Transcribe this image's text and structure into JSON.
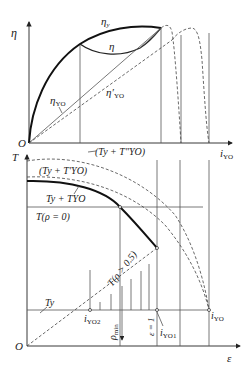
{
  "upper_plot": {
    "y_axis_label": "η",
    "x_axis_label_main": "i",
    "x_axis_label_sub": "YO",
    "origin_label": "O",
    "curves": {
      "eta_y": {
        "main": "η",
        "sub": "y"
      },
      "eta": {
        "main": "η"
      },
      "eta_yo": {
        "main": "η",
        "sub": "YO"
      },
      "eta_yo_prime": {
        "main": "η′",
        "sub": "YO"
      }
    }
  },
  "lower_plot": {
    "y_axis_label": "T",
    "x_axis_label": "ε",
    "origin_label": "O",
    "curves": {
      "ty_tyo_double_prime": "(T",
      "ty_tyo_double_prime_full": "(Ty + T″YO)",
      "ty_tyo_prime_full": "(Ty + T′YO)",
      "ty_tyo_full": "Ty + TYO",
      "t_rho_0": "T(ρ = 0)",
      "t_rho_05": "T(ρ > 0.5)",
      "t_y": "Ty"
    },
    "labels": {
      "i_yo2": {
        "main": "i",
        "sub": "YO2"
      },
      "i_yo1": {
        "main": "i",
        "sub": "YO1"
      },
      "i_yo": {
        "main": "i",
        "sub": "YO"
      },
      "rho_min": {
        "main": "ρ",
        "sub": "min"
      },
      "epsilon_eq_1": "ε = 1"
    }
  }
}
